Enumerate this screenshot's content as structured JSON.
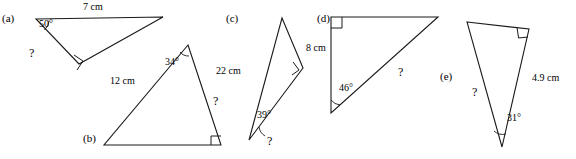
{
  "figure": {
    "stroke_color": "#1a1a1a",
    "background": "#ffffff"
  },
  "triangles": {
    "a": {
      "tag": "(a)",
      "angle_label": "50°",
      "side_top": "7 cm",
      "unknown": "?"
    },
    "b": {
      "tag": "(b)",
      "angle_label": "34°",
      "side": "12 cm",
      "unknown": "?"
    },
    "c": {
      "tag": "(c)",
      "angle_label": "39°",
      "side": "22 cm",
      "unknown": "?"
    },
    "d": {
      "tag": "(d)",
      "angle_label": "46°",
      "side": "8 cm",
      "unknown": "?"
    },
    "e": {
      "tag": "(e)",
      "angle_label": "31°",
      "side": "4.9 cm",
      "unknown": "?"
    }
  }
}
